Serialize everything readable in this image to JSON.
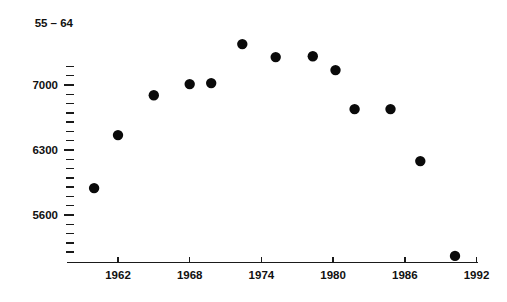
{
  "chart_data": {
    "type": "scatter",
    "title": "55 – 64",
    "xlabel": "",
    "ylabel": "",
    "xlim": [
      1959,
      1992
    ],
    "ylim": [
      5150,
      7300
    ],
    "grid": false,
    "legend": "none",
    "x_ticks": [
      1962,
      1968,
      1974,
      1980,
      1986,
      1992
    ],
    "x_tick_labels": [
      "1962",
      "1968",
      "1974",
      "1980",
      "1986",
      "1992"
    ],
    "y_ticks": [
      7000,
      6300,
      5600
    ],
    "y_tick_labels": [
      "7000",
      "6300",
      "5600"
    ],
    "y_minor_tick_step": 100,
    "series": [
      {
        "name": "55 – 64",
        "marker": "filled-circle",
        "color": "#0a0a0a",
        "points": [
          {
            "x": 1960,
            "y": 5890
          },
          {
            "x": 1962,
            "y": 6460
          },
          {
            "x": 1965,
            "y": 6890
          },
          {
            "x": 1968,
            "y": 7010
          },
          {
            "x": 1969.8,
            "y": 7020
          },
          {
            "x": 1972.4,
            "y": 7440
          },
          {
            "x": 1975.2,
            "y": 7300
          },
          {
            "x": 1978.3,
            "y": 7310
          },
          {
            "x": 1980.2,
            "y": 7160
          },
          {
            "x": 1981.8,
            "y": 6740
          },
          {
            "x": 1984.8,
            "y": 6740
          },
          {
            "x": 1987.3,
            "y": 6180
          },
          {
            "x": 1990.2,
            "y": 5160
          }
        ]
      }
    ]
  },
  "axis_labels": {
    "series_title": "55 – 64",
    "y_7000": "7000",
    "y_6300": "6300",
    "y_5600": "5600",
    "x_1962": "1962",
    "x_1968": "1968",
    "x_1974": "1974",
    "x_1980": "1980",
    "x_1986": "1986",
    "x_1992": "1992"
  },
  "colors": {
    "marker": "#0a0a0a",
    "axis": "#1a1a1a",
    "background": "#ffffff",
    "text": "#111111"
  }
}
